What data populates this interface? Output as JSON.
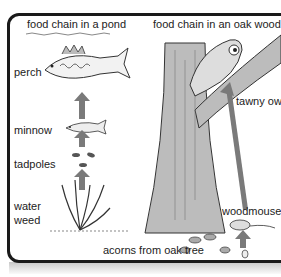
{
  "pond": {
    "title": "food chain in a pond",
    "labels": [
      "perch",
      "minnow",
      "tadpoles",
      "water",
      "weed"
    ]
  },
  "wood": {
    "title": "food chain in an oak wood",
    "labels": [
      "tawny owl",
      "woodmouse",
      "acorns from oak tree"
    ]
  },
  "colors": {
    "arrow": "#7a7a7a",
    "border": "#1a1a1a",
    "text": "#222222"
  }
}
